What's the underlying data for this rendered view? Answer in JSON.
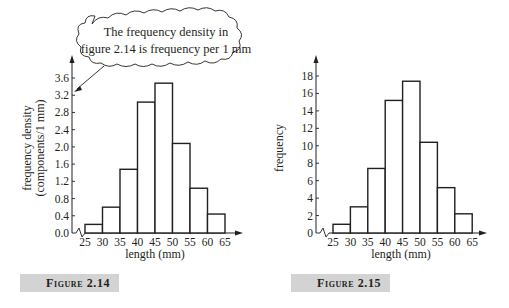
{
  "callout": {
    "line1": "The frequency density in",
    "line2": "figure 2.14 is frequency per 1 mm"
  },
  "figures": [
    {
      "caption": "Figure 2.14"
    },
    {
      "caption": "Figure 2.15"
    }
  ],
  "chart_data": [
    {
      "type": "bar",
      "title": "Figure 2.14",
      "xlabel": "length (mm)",
      "ylabel": "frequency density (components/1 mm)",
      "ylabel_line1": "frequency density",
      "ylabel_line2": "(components/1 mm)",
      "x_edges": [
        25,
        30,
        35,
        40,
        45,
        50,
        55,
        60,
        65
      ],
      "x_ticks": [
        "25",
        "30",
        "35",
        "40",
        "45",
        "50",
        "55",
        "60",
        "65"
      ],
      "categories": [
        "25-30",
        "30-35",
        "35-40",
        "40-45",
        "45-50",
        "50-55",
        "55-60",
        "60-65"
      ],
      "values": [
        0.2,
        0.6,
        1.48,
        3.04,
        3.48,
        2.08,
        1.04,
        0.44
      ],
      "y_ticks": [
        "0.0",
        "0.4",
        "0.8",
        "1.2",
        "1.6",
        "2.0",
        "2.4",
        "2.8",
        "3.2",
        "3.6"
      ],
      "ylim": [
        0,
        3.6
      ],
      "grid": false,
      "axis_break": true
    },
    {
      "type": "bar",
      "title": "Figure 2.15",
      "xlabel": "length (mm)",
      "ylabel": "frequency",
      "x_edges": [
        25,
        30,
        35,
        40,
        45,
        50,
        55,
        60,
        65
      ],
      "x_ticks": [
        "25",
        "30",
        "35",
        "40",
        "45",
        "50",
        "55",
        "60",
        "65"
      ],
      "categories": [
        "25-30",
        "30-35",
        "35-40",
        "40-45",
        "45-50",
        "50-55",
        "55-60",
        "60-65"
      ],
      "values": [
        1,
        3,
        7.4,
        15.2,
        17.4,
        10.4,
        5.2,
        2.2
      ],
      "y_ticks": [
        "0",
        "2",
        "4",
        "6",
        "8",
        "10",
        "12",
        "14",
        "16",
        "18"
      ],
      "ylim": [
        0,
        18
      ],
      "grid": false,
      "axis_break": true
    }
  ]
}
